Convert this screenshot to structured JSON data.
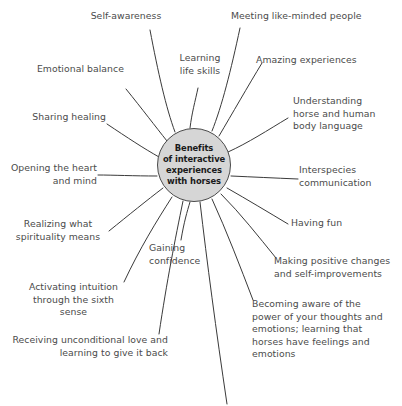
{
  "diagram": {
    "title": "Benefits of interactive experiences with horses",
    "type": "mind-map",
    "background_color": "#ffffff",
    "hub": {
      "text": "Benefits\nof interactive\nexperiences\nwith horses",
      "fill_color": "#d6d6d6",
      "stroke_color": "#4a4a4a",
      "text_color": "#1a1a1a"
    },
    "line_color": "#3a3a3a",
    "label_color": "#4b4b4b",
    "branches": [
      {
        "id": "self-awareness",
        "label": "Self-awareness"
      },
      {
        "id": "learning-life-skills",
        "label": "Learning\nlife skills"
      },
      {
        "id": "meeting-like-minded-people",
        "label": "Meeting like-minded people"
      },
      {
        "id": "amazing-experiences",
        "label": "Amazing experiences"
      },
      {
        "id": "understanding-body-language",
        "label": "Understanding\nhorse and human\nbody language"
      },
      {
        "id": "interspecies-communication",
        "label": "Interspecies\ncommunication"
      },
      {
        "id": "having-fun",
        "label": "Having fun"
      },
      {
        "id": "making-positive-changes",
        "label": "Making positive changes\nand self-improvements"
      },
      {
        "id": "becoming-aware-of-power",
        "label": "Becoming aware of the\npower of your thoughts and\nemotions; learning that\nhorses have feelings and\nemotions"
      },
      {
        "id": "receiving-unconditional-love",
        "label": "Receiving unconditional love and\nlearning to give it back"
      },
      {
        "id": "activating-intuition",
        "label": "Activating intuition\nthrough the sixth sense"
      },
      {
        "id": "gaining-confidence",
        "label": "Gaining\nconfidence"
      },
      {
        "id": "realizing-spirituality",
        "label": "Realizing what\nspirituality means"
      },
      {
        "id": "opening-the-heart",
        "label": "Opening the heart\nand mind"
      },
      {
        "id": "sharing-healing",
        "label": "Sharing healing"
      },
      {
        "id": "emotional-balance",
        "label": "Emotional balance"
      }
    ]
  }
}
